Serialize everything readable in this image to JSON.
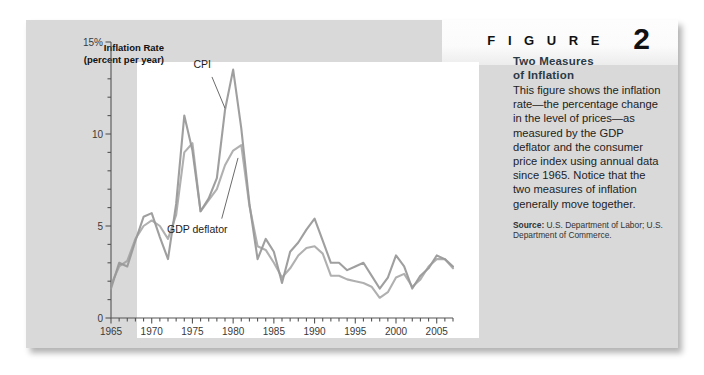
{
  "figure": {
    "label": "F I G U R E",
    "number": "2",
    "title_line1": "Two Measures",
    "title_line2": "of Inflation",
    "body": "This figure shows the inflation rate—the percentage change in the level of prices—as measured by the GDP deflator and the consumer price index using annual data since 1965. Notice that the two measures of inflation generally move together.",
    "source_label": "Source:",
    "source_text": "U.S. Department of Labor; U.S. Department of Commerce."
  },
  "colors": {
    "panel_bg": "#d9d9d9",
    "plot_bg": "#ffffff",
    "line_cpi": "#9a9a9a",
    "line_deflator": "#9a9a9a",
    "axis": "#555555",
    "text": "#1d1d1d"
  },
  "chart_data": {
    "type": "line",
    "title": "",
    "ylabel_line1": "Inflation Rate",
    "ylabel_line2": "(percent per year)",
    "xlabel": "",
    "ylim": [
      0,
      15
    ],
    "xlim": [
      1965,
      2007
    ],
    "ytick_labels": [
      "0",
      "5",
      "10",
      "15%"
    ],
    "ytick_values": [
      0,
      5,
      10,
      15
    ],
    "yminor_step": 1,
    "xtick_labels": [
      "1965",
      "1970",
      "1975",
      "1980",
      "1985",
      "1990",
      "1995",
      "2000",
      "2005"
    ],
    "xtick_values": [
      1965,
      1970,
      1975,
      1980,
      1985,
      1990,
      1995,
      2000,
      2005
    ],
    "xminor_step": 1,
    "grid": false,
    "legend": "annotations",
    "annotations": [
      {
        "text": "CPI",
        "x": 1976.2,
        "y": 13.6
      },
      {
        "text": "GDP deflator",
        "x": 1975.6,
        "y": 4.6
      }
    ],
    "x": [
      1965,
      1966,
      1967,
      1968,
      1969,
      1970,
      1971,
      1972,
      1973,
      1974,
      1975,
      1976,
      1977,
      1978,
      1979,
      1980,
      1981,
      1982,
      1983,
      1984,
      1985,
      1986,
      1987,
      1988,
      1989,
      1990,
      1991,
      1992,
      1993,
      1994,
      1995,
      1996,
      1997,
      1998,
      1999,
      2000,
      2001,
      2002,
      2003,
      2004,
      2005,
      2006,
      2007
    ],
    "series": [
      {
        "name": "CPI",
        "values": [
          1.6,
          3.0,
          2.8,
          4.2,
          5.5,
          5.7,
          4.4,
          3.2,
          6.2,
          11.0,
          9.1,
          5.8,
          6.5,
          7.6,
          11.3,
          13.5,
          10.3,
          6.2,
          3.2,
          4.3,
          3.6,
          1.9,
          3.6,
          4.1,
          4.8,
          5.4,
          4.2,
          3.0,
          3.0,
          2.6,
          2.8,
          3.0,
          2.3,
          1.6,
          2.2,
          3.4,
          2.8,
          1.6,
          2.3,
          2.7,
          3.4,
          3.2,
          2.8
        ]
      },
      {
        "name": "GDP deflator",
        "values": [
          1.8,
          2.8,
          3.1,
          4.3,
          5.0,
          5.3,
          5.0,
          4.3,
          5.6,
          9.0,
          9.5,
          5.8,
          6.4,
          7.0,
          8.3,
          9.1,
          9.4,
          6.1,
          3.9,
          3.7,
          3.0,
          2.2,
          2.7,
          3.4,
          3.8,
          3.9,
          3.5,
          2.3,
          2.3,
          2.1,
          2.0,
          1.9,
          1.7,
          1.1,
          1.4,
          2.2,
          2.4,
          1.7,
          2.1,
          2.8,
          3.2,
          3.2,
          2.7
        ]
      }
    ]
  }
}
